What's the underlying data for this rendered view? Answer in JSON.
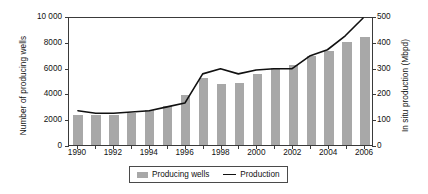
{
  "chart_data": {
    "type": "bar",
    "title": "",
    "subtitle": "",
    "xlabel": "",
    "ylabel": "Number of producing wells",
    "y2label": "In situ production (Mbpd)",
    "grid": false,
    "legend_position": "bottom-center",
    "x": [
      1990,
      1991,
      1992,
      1993,
      1994,
      1995,
      1996,
      1997,
      1998,
      1999,
      2000,
      2001,
      2002,
      2003,
      2004,
      2005,
      2006
    ],
    "categories": [
      "1990",
      "1991",
      "1992",
      "1993",
      "1994",
      "1995",
      "1996",
      "1997",
      "1998",
      "1999",
      "2000",
      "2001",
      "2002",
      "2003",
      "2004",
      "2005",
      "2006"
    ],
    "xlim": [
      1989.5,
      2006.5
    ],
    "ylim": [
      0,
      10000
    ],
    "y2lim": [
      0,
      500
    ],
    "ytick_labels": [
      "0",
      "2000",
      "4000",
      "6000",
      "8000",
      "10 000"
    ],
    "ytick_values": [
      0,
      2000,
      4000,
      6000,
      8000,
      10000
    ],
    "y2tick_labels": [
      "0",
      "100",
      "200",
      "300",
      "400",
      "500"
    ],
    "y2tick_values": [
      0,
      100,
      200,
      300,
      400,
      500
    ],
    "xtick_labels": [
      "1990",
      "1992",
      "1994",
      "1996",
      "1998",
      "2000",
      "2002",
      "2004",
      "2006"
    ],
    "xtick_values": [
      1990,
      1992,
      1994,
      1996,
      1998,
      2000,
      2002,
      2004,
      2006
    ],
    "series": [
      {
        "name": "Producing wells",
        "kind": "bar",
        "axis": "left",
        "unit": "wells",
        "color": "#a8a8a8",
        "values": [
          2300,
          2350,
          2350,
          2500,
          2700,
          3000,
          3900,
          5200,
          4700,
          4800,
          5500,
          6000,
          6200,
          6900,
          7300,
          8000,
          8400
        ]
      },
      {
        "name": "Production",
        "kind": "line",
        "axis": "right",
        "unit": "Mbpd",
        "color": "#111111",
        "values": [
          135,
          125,
          125,
          130,
          135,
          150,
          165,
          280,
          300,
          280,
          295,
          300,
          300,
          350,
          375,
          430,
          500
        ]
      }
    ]
  },
  "legend": {
    "entries": [
      {
        "label": "Producing wells",
        "marker": "bar-swatch"
      },
      {
        "label": "Production",
        "marker": "line-swatch"
      }
    ]
  }
}
